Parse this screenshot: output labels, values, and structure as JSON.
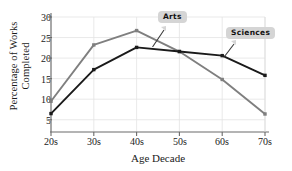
{
  "chart_data": {
    "type": "line",
    "title": "",
    "xlabel": "Age Decade",
    "ylabel_line1": "Percentage of Works",
    "ylabel_line2": "Completed",
    "categories": [
      "20s",
      "30s",
      "40s",
      "50s",
      "60s",
      "70s"
    ],
    "ylim": [
      2.5,
      31
    ],
    "yticks": [
      5,
      10,
      15,
      20,
      25,
      30
    ],
    "ytick_labels": [
      "5",
      "10",
      "15",
      "20",
      "25",
      "30"
    ],
    "grid": true,
    "legend_position": "inline-annotations",
    "series": [
      {
        "name": "Arts",
        "color": "#7f7f7f",
        "values": [
          9.5,
          23.2,
          26.7,
          21.6,
          14.8,
          6.4
        ]
      },
      {
        "name": "Sciences",
        "color": "#1a1a1a",
        "values": [
          6.5,
          17.2,
          22.6,
          21.6,
          20.6,
          15.8
        ]
      }
    ],
    "annotations": [
      {
        "label": "Arts",
        "points_to": "Arts series near 40s-50s"
      },
      {
        "label": "Sciences",
        "points_to": "Sciences series near 60s"
      }
    ]
  }
}
